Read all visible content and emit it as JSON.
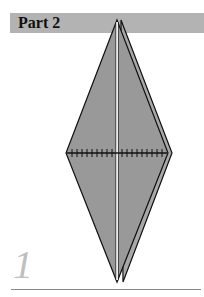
{
  "header": {
    "title": "Part 2"
  },
  "step": {
    "number": "1"
  },
  "colors": {
    "header_bg": "#b3b3b3",
    "paper_fill": "#999999",
    "outline": "#111111",
    "step_number": "#bfbfbf",
    "rule": "#888888"
  },
  "diagram": {
    "fold_line": "horizontal valley crease with tick marks"
  }
}
